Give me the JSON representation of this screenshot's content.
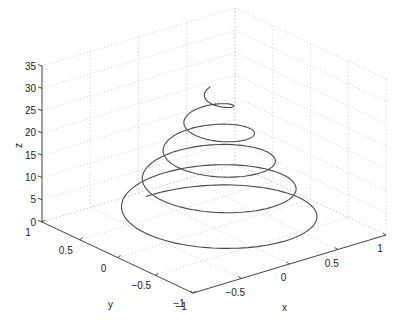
{
  "chart_data": {
    "type": "line3d",
    "title": "",
    "xlabel": "x",
    "ylabel": "y",
    "zlabel": "z",
    "xlim": [
      -1,
      1
    ],
    "ylim": [
      -1,
      1
    ],
    "zlim": [
      0,
      35
    ],
    "grid": true,
    "xticks": [
      -1,
      -0.5,
      0,
      0.5,
      1
    ],
    "yticks": [
      -1,
      -0.5,
      0,
      0.5,
      1
    ],
    "zticks": [
      0,
      5,
      10,
      15,
      20,
      25,
      30,
      35
    ],
    "xtick_labels": [
      "−1",
      "−0.5",
      "0",
      "0.5",
      "1"
    ],
    "ytick_labels": [
      "−1",
      "−0.5",
      "0",
      "0.5",
      "1"
    ],
    "ztick_labels": [
      "0",
      "5",
      "10",
      "15",
      "20",
      "25",
      "30",
      "35"
    ],
    "series": [
      {
        "name": "conical helix",
        "description": "x = r(t)·sin(t), y = r(t)·cos(t), z = t, t from 0 to 10π (5 turns); radius shrinks from ~0.9 at z=0 to ~0 at z≈31.4",
        "t_range": [
          0,
          31.4159
        ],
        "turns": 5,
        "radius_start": 0.9,
        "radius_end": 0.05,
        "z_start": 0,
        "z_end": 31.4
      }
    ],
    "line_color": "#4a4a4a",
    "grid_color": "#c8c8c8"
  },
  "projection": {
    "origin_px": [
      214,
      228.5
    ],
    "x_unit_px": [
      96.5,
      -29
    ],
    "y_unit_px": [
      -75.5,
      -35.5
    ],
    "z_unit_px": [
      0,
      -4.457
    ]
  }
}
